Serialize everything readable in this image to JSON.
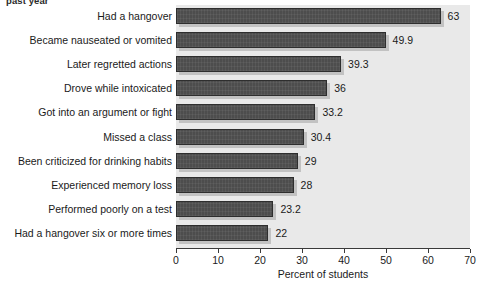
{
  "caption": {
    "fragment_text": "past year"
  },
  "chart_data": {
    "type": "bar",
    "orientation": "horizontal",
    "title": "",
    "subtitle": "",
    "xlabel": "Percent of students",
    "ylabel": "",
    "xlim": [
      0,
      70
    ],
    "xticks": [
      0,
      10,
      20,
      30,
      40,
      50,
      60,
      70
    ],
    "xtick_labels": [
      "0",
      "10",
      "20",
      "30",
      "40",
      "50",
      "60",
      "70"
    ],
    "grid": false,
    "legend": null,
    "plot_background_color": "#e9e9e9",
    "bar_color": "#4d4d4d",
    "bar_shadow_color": "#c2c2c2",
    "categories": [
      "Had a hangover",
      "Became nauseated or vomited",
      "Later regretted actions",
      "Drove while intoxicated",
      "Got into an argument or fight",
      "Missed a class",
      "Been criticized for drinking habits",
      "Experienced memory loss",
      "Performed poorly on a test",
      "Had a hangover six or more times"
    ],
    "values": [
      63,
      49.9,
      39.3,
      36,
      33.2,
      30.4,
      29,
      28,
      23.2,
      22
    ],
    "value_labels": [
      "63",
      "49.9",
      "39.3",
      "36",
      "33.2",
      "30.4",
      "29",
      "28",
      "23.2",
      "22"
    ]
  }
}
